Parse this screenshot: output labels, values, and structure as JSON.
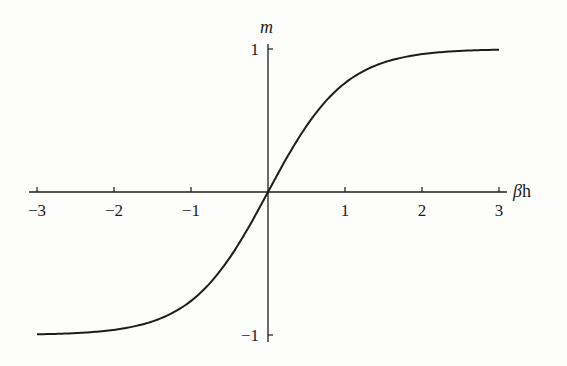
{
  "chart_data": {
    "type": "line",
    "title": "",
    "xlabel": "βh",
    "ylabel": "m",
    "xlim": [
      -3,
      3
    ],
    "ylim": [
      -1,
      1
    ],
    "grid": false,
    "legend": null,
    "x_ticks": [
      -3,
      -2,
      -1,
      1,
      2,
      3
    ],
    "x_tick_labels": [
      "−3",
      "−2",
      "−1",
      "1",
      "2",
      "3"
    ],
    "y_ticks": [
      1,
      -1
    ],
    "y_tick_labels": [
      "1",
      "−1"
    ],
    "series": [
      {
        "name": "m = tanh(βh)",
        "x": [
          -3,
          -2.75,
          -2.5,
          -2.25,
          -2,
          -1.75,
          -1.5,
          -1.25,
          -1,
          -0.75,
          -0.5,
          -0.25,
          0,
          0.25,
          0.5,
          0.75,
          1,
          1.25,
          1.5,
          1.75,
          2,
          2.25,
          2.5,
          2.75,
          3
        ],
        "y": [
          -0.995,
          -0.992,
          -0.987,
          -0.978,
          -0.964,
          -0.941,
          -0.905,
          -0.848,
          -0.762,
          -0.635,
          -0.462,
          -0.245,
          0,
          0.245,
          0.462,
          0.635,
          0.762,
          0.848,
          0.905,
          0.941,
          0.964,
          0.978,
          0.987,
          0.992,
          0.995
        ]
      }
    ]
  },
  "labels": {
    "x_axis_symbol": "β",
    "x_axis_suffix": "h",
    "y_axis": "m"
  },
  "colors": {
    "curve": "#1c1c1c",
    "axes": "#1c1c1c",
    "background": "#fdfdfc"
  }
}
